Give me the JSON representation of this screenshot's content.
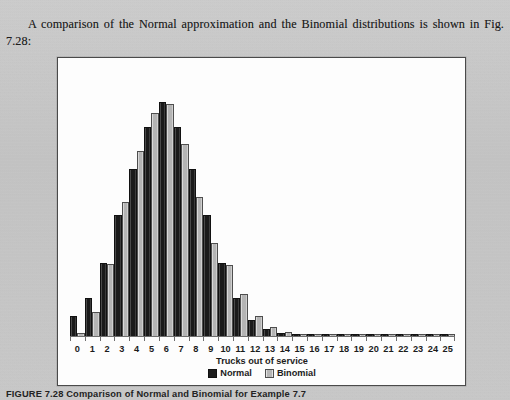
{
  "page": {
    "body_paragraph": "A comparison of the Normal approximation and the Binomial distributions is shown in Fig. 7.28:",
    "figure_caption": "FIGURE 7.28 Comparison of Normal and Binomial for Example 7.7"
  },
  "colors": {
    "paper": "#c9c9c9",
    "figure_background": "#fdfdfd",
    "figure_border": "#4a4a4a",
    "normal_series": "#1d1d1d",
    "binomial_series": "#b6b6b6",
    "axis": "#6e6e6e"
  },
  "chart_data": {
    "type": "bar",
    "title": "",
    "xlabel": "Trucks out of service",
    "ylabel": "",
    "grid": false,
    "legend_position": "bottom",
    "ylim": [
      0,
      0.175
    ],
    "categories": [
      "0",
      "1",
      "2",
      "3",
      "4",
      "5",
      "6",
      "7",
      "8",
      "9",
      "10",
      "11",
      "12",
      "13",
      "14",
      "15",
      "16",
      "17",
      "18",
      "19",
      "20",
      "21",
      "22",
      "23",
      "24",
      "25"
    ],
    "series": [
      {
        "name": "Normal",
        "color": "#1d1d1d",
        "values": [
          0.0135,
          0.0258,
          0.05,
          0.0835,
          0.116,
          0.145,
          0.1625,
          0.145,
          0.116,
          0.0835,
          0.05,
          0.0258,
          0.0105,
          0.004,
          0.0014,
          0.0005,
          0.0002,
          0.0001,
          0.0001,
          0.0001,
          0.0001,
          0.0,
          0.0,
          0.0,
          0.0,
          0.0
        ]
      },
      {
        "name": "Binomial",
        "color": "#b6b6b6",
        "values": [
          0.0015,
          0.016,
          0.0495,
          0.093,
          0.1285,
          0.1545,
          0.161,
          0.1335,
          0.0965,
          0.064,
          0.049,
          0.0285,
          0.0135,
          0.0055,
          0.0024,
          0.0009,
          0.0004,
          0.0002,
          0.0001,
          0.0001,
          0.0001,
          0.0,
          0.0,
          0.0,
          0.0,
          0.0
        ]
      }
    ]
  }
}
